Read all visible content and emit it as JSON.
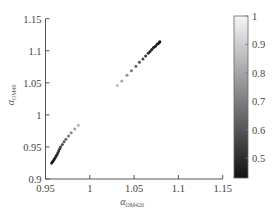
{
  "chart_data": {
    "type": "scatter",
    "title": "",
    "xlabel": "α_OM420",
    "xlabel_symbol": "α",
    "xlabel_sub": "OM420",
    "ylabel": "α_OM40",
    "ylabel_symbol": "α",
    "ylabel_sub": "OM40",
    "xlim": [
      0.95,
      1.15
    ],
    "ylim": [
      0.9,
      1.15
    ],
    "xticks": [
      0.95,
      1,
      1.05,
      1.1,
      1.15
    ],
    "xtick_labels": [
      "0.95",
      "1",
      "1.05",
      "1.1",
      "1.15"
    ],
    "yticks": [
      0.9,
      0.95,
      1,
      1.05,
      1.1,
      1.15
    ],
    "ytick_labels": [
      "0.9",
      "0.95",
      "1",
      "1.05",
      "1.1",
      "1.15"
    ],
    "grid": false,
    "colormap": "gray",
    "colorbar": {
      "range": [
        0.43,
        1.0
      ],
      "ticks": [
        0.5,
        0.6,
        0.7,
        0.8,
        0.9,
        1
      ],
      "tick_labels": [
        "0.5",
        "0.6",
        "0.7",
        "0.8",
        "0.9",
        "1"
      ],
      "position": "right"
    },
    "series": [
      {
        "name": "lower cluster",
        "points": [
          {
            "x": 0.957,
            "y": 0.925,
            "c": 0.43
          },
          {
            "x": 0.958,
            "y": 0.927,
            "c": 0.44
          },
          {
            "x": 0.959,
            "y": 0.929,
            "c": 0.45
          },
          {
            "x": 0.96,
            "y": 0.931,
            "c": 0.46
          },
          {
            "x": 0.961,
            "y": 0.933,
            "c": 0.47
          },
          {
            "x": 0.962,
            "y": 0.936,
            "c": 0.48
          },
          {
            "x": 0.963,
            "y": 0.938,
            "c": 0.49
          },
          {
            "x": 0.964,
            "y": 0.941,
            "c": 0.5
          },
          {
            "x": 0.965,
            "y": 0.944,
            "c": 0.52
          },
          {
            "x": 0.966,
            "y": 0.947,
            "c": 0.54
          },
          {
            "x": 0.967,
            "y": 0.95,
            "c": 0.56
          },
          {
            "x": 0.969,
            "y": 0.954,
            "c": 0.59
          },
          {
            "x": 0.971,
            "y": 0.958,
            "c": 0.62
          },
          {
            "x": 0.973,
            "y": 0.962,
            "c": 0.66
          },
          {
            "x": 0.976,
            "y": 0.967,
            "c": 0.7
          },
          {
            "x": 0.979,
            "y": 0.972,
            "c": 0.75
          },
          {
            "x": 0.983,
            "y": 0.978,
            "c": 0.8
          },
          {
            "x": 0.987,
            "y": 0.984,
            "c": 0.86
          }
        ]
      },
      {
        "name": "upper cluster",
        "points": [
          {
            "x": 1.031,
            "y": 1.046,
            "c": 0.88
          },
          {
            "x": 1.036,
            "y": 1.053,
            "c": 0.82
          },
          {
            "x": 1.042,
            "y": 1.062,
            "c": 0.76
          },
          {
            "x": 1.047,
            "y": 1.069,
            "c": 0.7
          },
          {
            "x": 1.052,
            "y": 1.076,
            "c": 0.65
          },
          {
            "x": 1.056,
            "y": 1.082,
            "c": 0.6
          },
          {
            "x": 1.06,
            "y": 1.087,
            "c": 0.56
          },
          {
            "x": 1.063,
            "y": 1.092,
            "c": 0.53
          },
          {
            "x": 1.066,
            "y": 1.096,
            "c": 0.5
          },
          {
            "x": 1.068,
            "y": 1.099,
            "c": 0.48
          },
          {
            "x": 1.07,
            "y": 1.102,
            "c": 0.47
          },
          {
            "x": 1.072,
            "y": 1.105,
            "c": 0.46
          },
          {
            "x": 1.074,
            "y": 1.107,
            "c": 0.45
          },
          {
            "x": 1.076,
            "y": 1.11,
            "c": 0.44
          },
          {
            "x": 1.078,
            "y": 1.112,
            "c": 0.44
          },
          {
            "x": 1.079,
            "y": 1.114,
            "c": 0.43
          }
        ]
      }
    ]
  }
}
